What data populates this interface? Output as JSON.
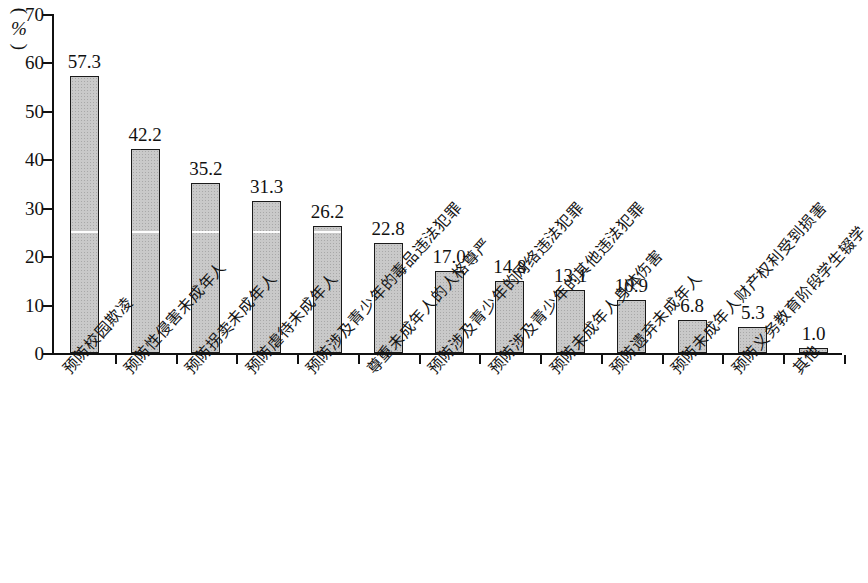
{
  "chart_data": {
    "type": "bar",
    "title": "",
    "subtitle": "",
    "xlabel": "",
    "ylabel": "(%)",
    "ylim": [
      0,
      70
    ],
    "y_ticks": [
      0,
      10,
      20,
      30,
      40,
      50,
      60,
      70
    ],
    "grid": false,
    "legend": null,
    "orientation": "vertical",
    "bar_color": "#c9c9c9",
    "bar_border_color": "#1a1a1a",
    "categories": [
      "预防校园欺凌",
      "预防性侵害未成年人",
      "预防拐卖未成年人",
      "预防虐待未成年人",
      "预防涉及青少年的毒品违法犯罪",
      "尊重未成年人的人格尊严",
      "预防涉及青少年的网络违法犯罪",
      "预防涉及青少年的其他违法犯罪",
      "预防未成年人身体伤害",
      "预防遗弃未成年人",
      "预防未成年人财产权利受到损害",
      "预防义务教育阶段学生辍学",
      "其他"
    ],
    "values": [
      57.3,
      42.2,
      35.2,
      31.3,
      26.2,
      22.8,
      17.0,
      14.8,
      13.1,
      10.9,
      6.8,
      5.3,
      1.0
    ],
    "value_labels": [
      "57.3",
      "42.2",
      "35.2",
      "31.3",
      "26.2",
      "22.8",
      "17.0",
      "14.8",
      "13.1",
      "10.9",
      "6.8",
      "5.3",
      "1.0"
    ],
    "y_tick_labels": [
      "0",
      "10",
      "20",
      "30",
      "40",
      "50",
      "60",
      "70"
    ]
  },
  "axis": {
    "unit_label_open_paren": "(",
    "unit_label_text": "%",
    "unit_label_close_paren": ")"
  }
}
